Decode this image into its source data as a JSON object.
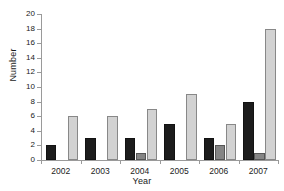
{
  "chart_data": {
    "type": "bar",
    "title": "",
    "xlabel": "Year",
    "ylabel": "Number",
    "categories": [
      "2002",
      "2003",
      "2004",
      "2005",
      "2006",
      "2007"
    ],
    "series": [
      {
        "name": "series-1",
        "color": "#1c1c1c",
        "values": [
          2,
          3,
          3,
          5,
          3,
          8
        ]
      },
      {
        "name": "series-2",
        "color": "#858585",
        "values": [
          0,
          0,
          1,
          0,
          2,
          1
        ]
      },
      {
        "name": "series-3",
        "color": "#d2d2d2",
        "values": [
          6,
          6,
          7,
          9,
          5,
          18
        ]
      }
    ],
    "ylim": [
      0,
      20
    ],
    "yticks": [
      0,
      2,
      4,
      6,
      8,
      10,
      12,
      14,
      16,
      18,
      20
    ],
    "ytick_labels": [
      "0",
      "2",
      "4",
      "6",
      "8",
      "10",
      "12",
      "14",
      "16",
      "18",
      "20"
    ],
    "grid": false,
    "legend": "none"
  }
}
